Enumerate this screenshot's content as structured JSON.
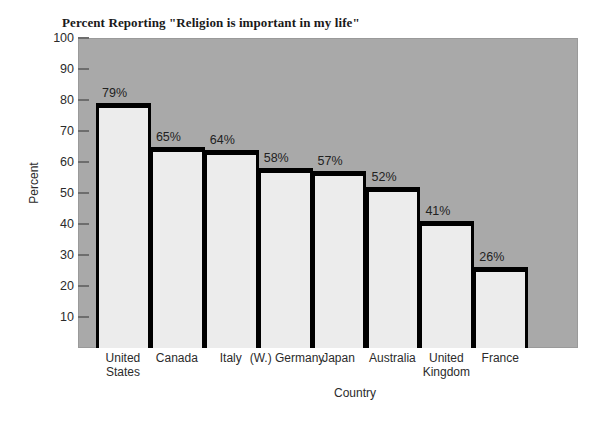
{
  "chart_data": {
    "type": "bar",
    "title": "Percent Reporting \"Religion is important in my life\"",
    "xlabel": "Country",
    "ylabel": "Percent",
    "categories": [
      "United States",
      "Canada",
      "Italy",
      "(W.) Germany",
      "Japan",
      "Australia",
      "United Kingdom",
      "France"
    ],
    "category_lines": [
      [
        "United",
        "States"
      ],
      [
        "Canada"
      ],
      [
        "Italy"
      ],
      [
        "(W.) Germany"
      ],
      [
        "Japan"
      ],
      [
        "Australia"
      ],
      [
        "United",
        "Kingdom"
      ],
      [
        "France"
      ]
    ],
    "values": [
      79,
      65,
      64,
      58,
      57,
      52,
      41,
      26
    ],
    "value_labels": [
      "79%",
      "65%",
      "64%",
      "58%",
      "57%",
      "52%",
      "41%",
      "26%"
    ],
    "ylim": [
      0,
      100
    ],
    "yticks": [
      100,
      90,
      80,
      70,
      60,
      50,
      40,
      30,
      20,
      10
    ],
    "ytick_labels": [
      "100",
      "90",
      "80",
      "70",
      "60",
      "50",
      "40",
      "30",
      "20",
      "10"
    ],
    "grid": false,
    "legend": "none",
    "colors": {
      "plot_background": "#a9a9a9",
      "bar_fill": "#ececec",
      "bar_outline": "#000000",
      "page_background": "#ffffff",
      "text": "#2b2b2b",
      "tick": "#6d6d6d"
    }
  }
}
